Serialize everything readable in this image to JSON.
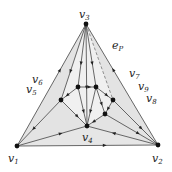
{
  "diagram": {
    "type": "planar-graph-triangulation",
    "outer_face_color": "#f0f0f0",
    "inner_face_color": "#e3e3e3",
    "edge_color": "#444444",
    "nodes": [
      {
        "id": "v1",
        "label": "v",
        "sub": "1"
      },
      {
        "id": "v2",
        "label": "v",
        "sub": "2"
      },
      {
        "id": "v3",
        "label": "v",
        "sub": "3"
      },
      {
        "id": "v4",
        "label": "v",
        "sub": "4"
      },
      {
        "id": "a"
      },
      {
        "id": "b"
      },
      {
        "id": "c"
      },
      {
        "id": "d"
      },
      {
        "id": "e"
      }
    ],
    "side_labels": [
      {
        "id": "v5",
        "label": "v",
        "sub": "5"
      },
      {
        "id": "v6",
        "label": "v",
        "sub": "6"
      },
      {
        "id": "v7",
        "label": "v",
        "sub": "7"
      },
      {
        "id": "v8",
        "label": "v",
        "sub": "8"
      },
      {
        "id": "v9",
        "label": "v",
        "sub": "9"
      }
    ],
    "path_label": {
      "label": "e",
      "sub": "P"
    },
    "edges": [
      [
        "v1",
        "v2"
      ],
      [
        "v1",
        "v3"
      ],
      [
        "v2",
        "v3"
      ],
      [
        "v1",
        "v4"
      ],
      [
        "v2",
        "v4"
      ],
      [
        "v3",
        "c"
      ],
      [
        "v3",
        "a"
      ],
      [
        "v3",
        "b"
      ],
      [
        "v3",
        "v4"
      ],
      [
        "a",
        "b"
      ],
      [
        "a",
        "c"
      ],
      [
        "b",
        "d"
      ],
      [
        "c",
        "v4"
      ],
      [
        "a",
        "v4"
      ],
      [
        "b",
        "v4"
      ],
      [
        "d",
        "e"
      ],
      [
        "e",
        "v4"
      ],
      [
        "e",
        "v2"
      ],
      [
        "d",
        "v2"
      ],
      [
        "c",
        "v1"
      ],
      [
        "b",
        "e"
      ]
    ],
    "dashed_edges": [
      [
        "v3",
        "d"
      ]
    ]
  }
}
